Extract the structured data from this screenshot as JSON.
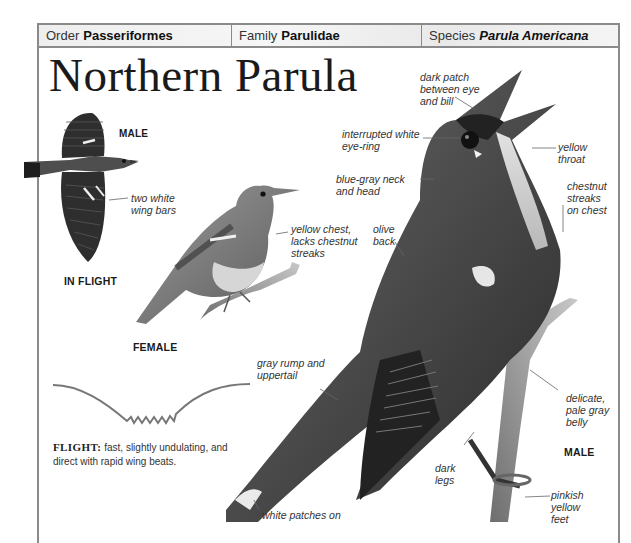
{
  "taxonomy": {
    "order_label": "Order",
    "order_value": "Passeriformes",
    "family_label": "Family",
    "family_value": "Parulidae",
    "species_label": "Species",
    "species_value": "Parula Americana"
  },
  "title": "Northern Parula",
  "captions": {
    "male_flight": "MALE",
    "in_flight": "IN FLIGHT",
    "female": "FEMALE",
    "male_main": "MALE"
  },
  "labels": {
    "two_white_wing_bars": "two white\nwing bars",
    "yellow_chest_female": "yellow chest,\nlacks chestnut\nstreaks",
    "dark_patch": "dark patch\nbetween eye\nand bill",
    "interrupted_eye_ring": "interrupted white\neye-ring",
    "yellow_throat": "yellow\nthroat",
    "blue_gray_neck": "blue-gray neck\nand head",
    "chestnut_streaks": "chestnut\nstreaks\non chest",
    "olive_back": "olive\nback",
    "gray_rump": "gray rump and\nuppertail",
    "delicate_belly": "delicate,\npale gray\nbelly",
    "dark_legs": "dark\nlegs",
    "pinkish_feet": "pinkish\nyellow\nfeet",
    "white_patches": "white patches on"
  },
  "flight": {
    "label": "FLIGHT:",
    "description": "fast, slightly undulating, and direct with rapid wing beats."
  },
  "colors": {
    "border": "#8a8a8a",
    "header_bg": "#eeeeee",
    "text": "#1a1a1a"
  }
}
